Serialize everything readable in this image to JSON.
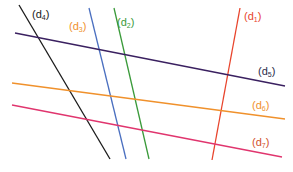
{
  "diagram": {
    "type": "lines",
    "lines": [
      {
        "id": "d1",
        "name": "d",
        "sub": "1",
        "color": "#e8442c",
        "x1": 240,
        "y1": 8,
        "x2": 212,
        "y2": 160,
        "label_x": 244,
        "label_y": 11
      },
      {
        "id": "d2",
        "name": "d",
        "sub": "2",
        "color": "#3a9a3a",
        "x1": 114,
        "y1": 8,
        "x2": 149,
        "y2": 159,
        "label_x": 117,
        "label_y": 17
      },
      {
        "id": "d3",
        "name": "d",
        "sub": "3",
        "color": "#4a6fc0",
        "x1": 89,
        "y1": 8,
        "x2": 126,
        "y2": 159,
        "label_x": 69,
        "label_y": 21
      },
      {
        "id": "d4",
        "name": "d",
        "sub": "4",
        "color": "#1a1a1a",
        "x1": 19,
        "y1": 5,
        "x2": 110,
        "y2": 159,
        "label_x": 32,
        "label_y": 9
      },
      {
        "id": "d5",
        "name": "d",
        "sub": "5",
        "color": "#3a2060",
        "x1": 15,
        "y1": 33,
        "x2": 285,
        "y2": 86,
        "label_x": 258,
        "label_y": 66
      },
      {
        "id": "d6",
        "name": "d",
        "sub": "6",
        "color": "#f0912c",
        "x1": 12,
        "y1": 83,
        "x2": 285,
        "y2": 119,
        "label_x": 252,
        "label_y": 100
      },
      {
        "id": "d7",
        "name": "d",
        "sub": "7",
        "color": "#e0356e",
        "x1": 12,
        "y1": 105,
        "x2": 282,
        "y2": 157,
        "label_x": 252,
        "label_y": 137
      }
    ],
    "label_colors": {
      "d1": "#e8442c",
      "d2": "#3a9a3a",
      "d3": "#f0912c",
      "d4": "#1a1a1a",
      "d5": "#2a2a4a",
      "d6": "#f0912c",
      "d7": "#d2502a"
    }
  }
}
